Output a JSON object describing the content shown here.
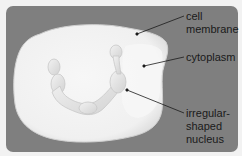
{
  "diagram": {
    "type": "labeled-illustration",
    "colors": {
      "background": "#f2f2f2",
      "panel": "#7f7f7f",
      "cell_fill": "#f4f4f4",
      "nucleus_fill": "#e4e4e4",
      "leader_line": "#1a1a1a",
      "label_text": "#1a1a1a"
    },
    "labels": [
      {
        "id": "cell-membrane",
        "lines": [
          "cell",
          "membrane"
        ],
        "anchor": [
          137,
          34
        ],
        "text_pos": [
          186,
          10
        ]
      },
      {
        "id": "cytoplasm",
        "lines": [
          "cytoplasm"
        ],
        "anchor": [
          144,
          66
        ],
        "text_pos": [
          186,
          51
        ]
      },
      {
        "id": "nucleus",
        "lines": [
          "irregular-",
          "shaped",
          "nucleus"
        ],
        "anchor": [
          127,
          90
        ],
        "text_pos": [
          186,
          107
        ]
      }
    ]
  }
}
